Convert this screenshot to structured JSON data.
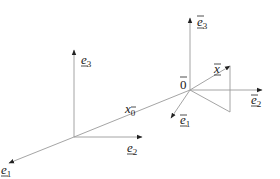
{
  "diagram": {
    "type": "coordinate-frames",
    "global_frame": {
      "origin_label": "",
      "axes": [
        {
          "name": "e1",
          "label": "e",
          "subscript": "1",
          "underline": true
        },
        {
          "name": "e2",
          "label": "e",
          "subscript": "2",
          "underline": true
        },
        {
          "name": "e3",
          "label": "e",
          "subscript": "3",
          "underline": true
        }
      ]
    },
    "local_frame": {
      "origin_label": "0",
      "origin_overline": true,
      "axes": [
        {
          "name": "e1-bar",
          "label": "e",
          "subscript": "1",
          "underline": true,
          "overline": true
        },
        {
          "name": "e2-bar",
          "label": "e",
          "subscript": "2",
          "underline": true,
          "overline": true
        },
        {
          "name": "e3-bar",
          "label": "e",
          "subscript": "3",
          "underline": true,
          "overline": true
        }
      ]
    },
    "vectors": [
      {
        "name": "x0",
        "label": "x",
        "subscript": "0",
        "subscript_overline": true
      },
      {
        "name": "x-bar",
        "label": "x",
        "overline": true,
        "underline": true
      }
    ]
  },
  "labels": {
    "e1": {
      "base": "e",
      "sub": "1"
    },
    "e2": {
      "base": "e",
      "sub": "2"
    },
    "e3": {
      "base": "e",
      "sub": "3"
    },
    "eb1": {
      "base": "e",
      "sub": "1"
    },
    "eb2": {
      "base": "e",
      "sub": "2"
    },
    "eb3": {
      "base": "e",
      "sub": "3"
    },
    "origin": "0",
    "x0": {
      "base": "x",
      "sub": "0"
    },
    "xbar": {
      "base": "x"
    }
  },
  "colors": {
    "lines": "#9a9a9a",
    "text": "#222222",
    "background": "#ffffff"
  }
}
